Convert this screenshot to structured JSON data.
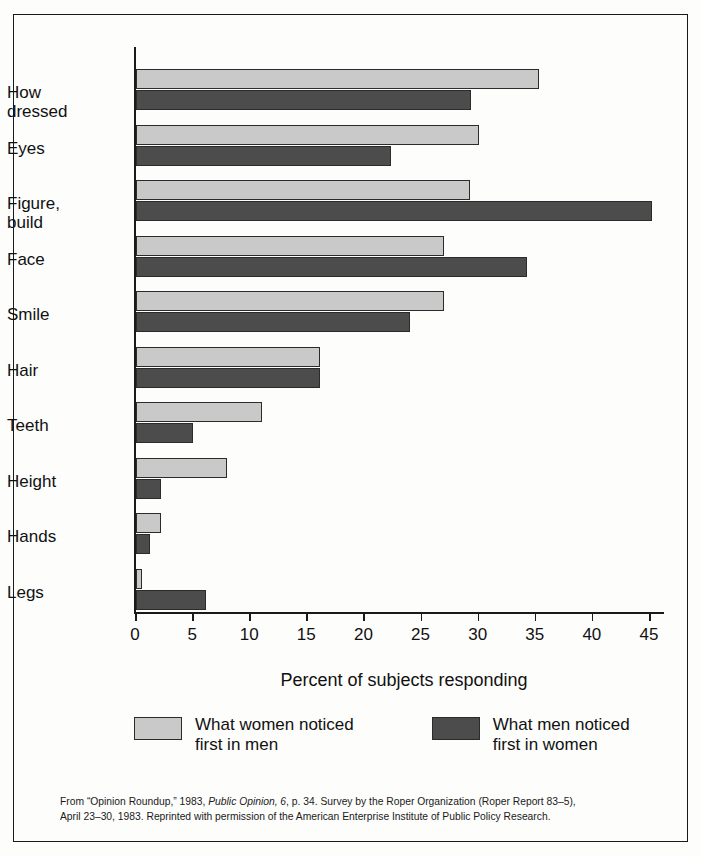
{
  "chart_data": {
    "type": "bar",
    "orientation": "horizontal",
    "title": "",
    "xlabel": "Percent of subjects responding",
    "ylabel": "",
    "xlim": [
      0,
      45
    ],
    "xticks": [
      0,
      5,
      10,
      15,
      20,
      25,
      30,
      35,
      40,
      45
    ],
    "grid": false,
    "legend_position": "bottom",
    "categories": [
      "How\ndressed",
      "Eyes",
      "Figure,\nbuild",
      "Face",
      "Smile",
      "Hair",
      "Teeth",
      "Height",
      "Hands",
      "Legs"
    ],
    "series": [
      {
        "name": "What women noticed\nfirst in men",
        "color": "#c9c9c9",
        "values": [
          35.3,
          30.0,
          29.2,
          27.0,
          27.0,
          16.1,
          11.0,
          8.0,
          2.2,
          0.5
        ]
      },
      {
        "name": "What men noticed\nfirst in women",
        "color": "#4c4c4c",
        "values": [
          29.3,
          22.3,
          45.2,
          34.2,
          24.0,
          16.1,
          5.0,
          2.2,
          1.2,
          6.1
        ]
      }
    ]
  },
  "legend": [
    {
      "label": "What women noticed\nfirst in men",
      "swatch": "light"
    },
    {
      "label": "What men noticed\nfirst in women",
      "swatch": "dark"
    }
  ],
  "caption": {
    "line1_a": "From “Opinion Roundup,” 1983, ",
    "line1_italic": "Public Opinion, 6",
    "line1_b": ", p. 34. Survey by the Roper Organization (Roper Report 83–5),",
    "line2": "April 23–30, 1983. Reprinted with permission of the American Enterprise Institute of Public Policy Research."
  }
}
